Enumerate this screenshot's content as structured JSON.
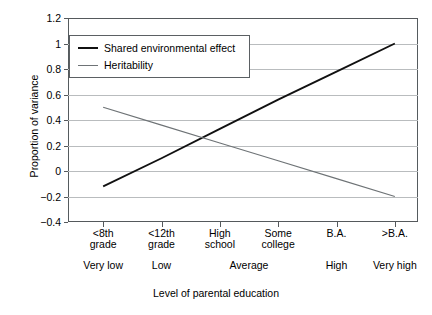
{
  "chart_data": {
    "type": "line",
    "title": "",
    "xlabel": "Level of parental education",
    "ylabel": "Proportion of variance",
    "ylim": [
      -0.4,
      1.2
    ],
    "yticks": [
      1.2,
      1,
      0.8,
      0.6,
      0.4,
      0.2,
      0,
      -0.2,
      -0.4
    ],
    "ytick_labels": [
      "1.2",
      "1",
      "0.8",
      "0.6",
      "0.4",
      "0.2",
      "0",
      "−0.2",
      "−0.4"
    ],
    "grid": true,
    "legend_position": "upper left (inside axes)",
    "categories": [
      "<8th grade",
      "<12th grade",
      "High school",
      "Some college",
      "B.A.",
      ">B.A."
    ],
    "category_lines": [
      [
        "<8th",
        "grade"
      ],
      [
        "<12th",
        "grade"
      ],
      [
        "High",
        "school"
      ],
      [
        "Some",
        "college"
      ],
      [
        "B.A.",
        ""
      ],
      [
        ">B.A.",
        ""
      ]
    ],
    "category_bands": [
      {
        "label": "Very low",
        "span": [
          0,
          0
        ]
      },
      {
        "label": "Low",
        "span": [
          1,
          1
        ]
      },
      {
        "label": "Average",
        "span": [
          2,
          3
        ]
      },
      {
        "label": "High",
        "span": [
          4,
          4
        ]
      },
      {
        "label": "Very high",
        "span": [
          5,
          5
        ]
      }
    ],
    "series": [
      {
        "name": "Shared environmental effect",
        "color": "#111111",
        "width": 1.9,
        "values": [
          -0.12,
          0.1,
          0.33,
          0.56,
          0.78,
          1.0
        ]
      },
      {
        "name": "Heritability",
        "color": "#6e7376",
        "width": 1.2,
        "values": [
          0.5,
          0.36,
          0.22,
          0.08,
          -0.06,
          -0.2
        ]
      }
    ],
    "crossing_point": {
      "x_fraction": 0.35,
      "y": 0.23
    }
  },
  "axes": {
    "ylabel": "Proportion of variance",
    "xlabel": "Level of parental education"
  },
  "legend": {
    "items": [
      {
        "label": "Shared environmental effect",
        "style": "dark"
      },
      {
        "label": "Heritability",
        "style": "light"
      }
    ]
  },
  "colors": {
    "series_dark": "#111111",
    "series_light": "#6e7376",
    "gridline": "#b9bcbe",
    "frame": "#55595c",
    "background": "#ffffff"
  },
  "caption_partial": ""
}
